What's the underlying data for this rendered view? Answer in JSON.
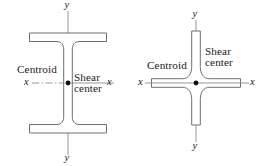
{
  "figure": {
    "caption": "",
    "background_color": "#ffffff",
    "line_color": "#6f6f6f",
    "axis_color": "#8a8a8a",
    "point_color": "#111111",
    "panels": [
      {
        "id": "i-beam",
        "shape_name": "wide-flange-i-beam-section",
        "labels": {
          "centroid": "Centroid",
          "shear_line1": "Shear",
          "shear_line2": "center",
          "x_axis_left": "x",
          "x_axis_right": "x",
          "y_axis_top": "y",
          "y_axis_bottom": "y"
        }
      },
      {
        "id": "cruciform",
        "shape_name": "cruciform-cross-section",
        "labels": {
          "centroid": "Centroid",
          "shear_line1": "Shear",
          "shear_line2": "center",
          "x_axis_left": "x",
          "x_axis_right": "x",
          "y_axis_top": "y",
          "y_axis_bottom": "y"
        }
      }
    ]
  }
}
